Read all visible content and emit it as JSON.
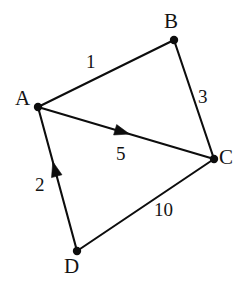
{
  "figure": {
    "kind": "weighted-directed-graph",
    "background_color": "#ffffff",
    "stroke_color": "#0d0d0d",
    "text_color": "#131313"
  },
  "nodes": [
    {
      "id": "A",
      "label": "A",
      "x": 38,
      "y": 107,
      "label_x": 15,
      "label_y": 88
    },
    {
      "id": "B",
      "label": "B",
      "x": 174,
      "y": 40,
      "label_x": 164,
      "label_y": 11
    },
    {
      "id": "C",
      "label": "C",
      "x": 214,
      "y": 159,
      "label_x": 219,
      "label_y": 147
    },
    {
      "id": "D",
      "label": "D",
      "x": 77,
      "y": 251,
      "label_x": 64,
      "label_y": 256
    }
  ],
  "edges": [
    {
      "id": "A-B",
      "from": "A",
      "to": "B",
      "weight": "1",
      "directed": false,
      "label_x": 86,
      "label_y": 52
    },
    {
      "id": "B-C",
      "from": "B",
      "to": "C",
      "weight": "3",
      "directed": false,
      "label_x": 198,
      "label_y": 87
    },
    {
      "id": "A-C",
      "from": "A",
      "to": "C",
      "weight": "5",
      "directed": true,
      "arrow_at": 0.52,
      "label_x": 116,
      "label_y": 144
    },
    {
      "id": "D-A",
      "from": "D",
      "to": "A",
      "weight": "2",
      "directed": true,
      "arrow_at": 0.62,
      "label_x": 35,
      "label_y": 175
    },
    {
      "id": "D-C",
      "from": "D",
      "to": "C",
      "weight": "10",
      "directed": false,
      "label_x": 154,
      "label_y": 200
    }
  ]
}
